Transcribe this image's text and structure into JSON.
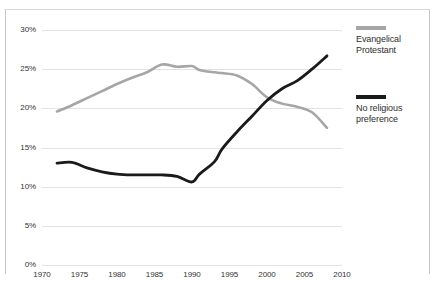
{
  "top_strip": {
    "partial_text": "— — — — — — — — — — — — — — — — — — — — — — — — — —"
  },
  "legend": {
    "position": "right",
    "entries": [
      {
        "name": "Evangelical Protestant",
        "line1": "Evangelical",
        "line2": "Protestant",
        "color": "#a6a6a6"
      },
      {
        "name": "No religious preference",
        "line1": "No religious",
        "line2": "preference",
        "color": "#1a1a1a"
      }
    ]
  },
  "chart_data": {
    "type": "line",
    "title": "",
    "subtitle": "",
    "xlabel": "",
    "ylabel": "",
    "xlim": [
      1970,
      2010
    ],
    "ylim": [
      0,
      30
    ],
    "grid": true,
    "legend_position": "right",
    "ytick_labels": [
      "30%",
      "25%",
      "20%",
      "15%",
      "10%",
      "5%",
      "0%"
    ],
    "ytick_values": [
      30,
      25,
      20,
      15,
      10,
      5,
      0
    ],
    "xtick_labels": [
      "1970",
      "1975",
      "1980",
      "1985",
      "1990",
      "1995",
      "2000",
      "2005",
      "2010"
    ],
    "xtick_values": [
      1970,
      1975,
      1980,
      1985,
      1990,
      1995,
      2000,
      2005,
      2010
    ],
    "series": [
      {
        "name": "Evangelical Protestant",
        "color": "#a6a6a6",
        "x": [
          1972,
          1974,
          1976,
          1978,
          1980,
          1982,
          1984,
          1986,
          1988,
          1990,
          1991,
          1993,
          1994,
          1996,
          1998,
          2000,
          2002,
          2004,
          2006,
          2008
        ],
        "values": [
          19.6,
          20.4,
          21.3,
          22.2,
          23.1,
          23.9,
          24.6,
          25.6,
          25.3,
          25.4,
          24.9,
          24.6,
          24.5,
          24.2,
          23.1,
          21.4,
          20.6,
          20.2,
          19.5,
          17.5
        ]
      },
      {
        "name": "No religious preference",
        "color": "#1a1a1a",
        "x": [
          1972,
          1974,
          1976,
          1978,
          1980,
          1982,
          1984,
          1986,
          1988,
          1990,
          1991,
          1993,
          1994,
          1996,
          1998,
          2000,
          2002,
          2004,
          2006,
          2008
        ],
        "values": [
          13.0,
          13.1,
          12.4,
          11.9,
          11.6,
          11.5,
          11.5,
          11.5,
          11.3,
          10.6,
          11.6,
          13.2,
          14.8,
          17.0,
          19.0,
          21.0,
          22.5,
          23.5,
          25.0,
          26.7
        ]
      }
    ],
    "annotations": [
      {
        "name": "crossover",
        "year": 1999,
        "value": 21.0
      }
    ]
  }
}
